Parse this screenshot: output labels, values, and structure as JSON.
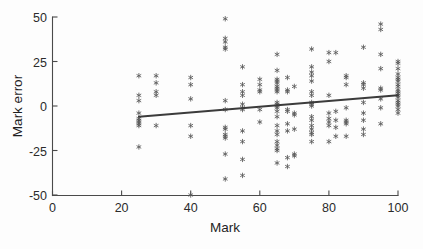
{
  "figure": {
    "background_color": "#fdfdfd",
    "axis_color": "#4a4a4a",
    "marker_color": "#5a5a5a",
    "fit_line_color": "#3b3b3b",
    "marker_symbol": "asterisk"
  },
  "chart_data": {
    "type": "scatter",
    "title": "",
    "xlabel": "Mark",
    "ylabel": "Mark error",
    "xlim": [
      0,
      100
    ],
    "ylim": [
      -50,
      50
    ],
    "xticks": [
      0,
      20,
      40,
      60,
      80,
      100
    ],
    "yticks": [
      -50,
      -25,
      0,
      25,
      50
    ],
    "xticklabels": [
      "0",
      "20",
      "40",
      "60",
      "80",
      "100"
    ],
    "yticklabels": [
      "-50",
      "-25",
      "0",
      "25",
      "50"
    ],
    "grid": false,
    "legend": null,
    "legend_position": "none",
    "marker": "*",
    "series": [
      {
        "name": "Mark error vs Mark",
        "points": [
          [
            25,
            17
          ],
          [
            25,
            6
          ],
          [
            25,
            3
          ],
          [
            25,
            -4
          ],
          [
            25,
            -7
          ],
          [
            25,
            -8
          ],
          [
            25,
            -9
          ],
          [
            25,
            -10
          ],
          [
            25,
            -11
          ],
          [
            25,
            -23
          ],
          [
            30,
            17
          ],
          [
            30,
            13
          ],
          [
            30,
            8
          ],
          [
            30,
            6
          ],
          [
            30,
            -11
          ],
          [
            40,
            16
          ],
          [
            40,
            12
          ],
          [
            40,
            4
          ],
          [
            40,
            -11
          ],
          [
            40,
            -17
          ],
          [
            40,
            -50
          ],
          [
            50,
            49
          ],
          [
            50,
            38
          ],
          [
            50,
            36
          ],
          [
            50,
            33
          ],
          [
            50,
            32
          ],
          [
            50,
            3
          ],
          [
            50,
            -2
          ],
          [
            50,
            -12
          ],
          [
            50,
            -13
          ],
          [
            50,
            -16
          ],
          [
            50,
            -17
          ],
          [
            50,
            -18
          ],
          [
            50,
            -27
          ],
          [
            50,
            -41
          ],
          [
            55,
            22
          ],
          [
            55,
            12
          ],
          [
            55,
            8
          ],
          [
            55,
            6
          ],
          [
            55,
            1
          ],
          [
            55,
            -1
          ],
          [
            55,
            -2
          ],
          [
            55,
            -14
          ],
          [
            55,
            -20
          ],
          [
            55,
            -30
          ],
          [
            55,
            -39
          ],
          [
            60,
            15
          ],
          [
            60,
            12
          ],
          [
            60,
            9
          ],
          [
            60,
            8
          ],
          [
            60,
            -2
          ],
          [
            60,
            -9
          ],
          [
            65,
            29
          ],
          [
            65,
            20
          ],
          [
            65,
            15
          ],
          [
            65,
            14
          ],
          [
            65,
            13
          ],
          [
            65,
            11
          ],
          [
            65,
            10
          ],
          [
            65,
            9
          ],
          [
            65,
            8
          ],
          [
            65,
            2
          ],
          [
            65,
            1
          ],
          [
            65,
            0
          ],
          [
            65,
            -1
          ],
          [
            65,
            -3
          ],
          [
            65,
            -6
          ],
          [
            65,
            -11
          ],
          [
            65,
            -14
          ],
          [
            65,
            -16
          ],
          [
            65,
            -20
          ],
          [
            65,
            -22
          ],
          [
            65,
            -24
          ],
          [
            65,
            -25
          ],
          [
            65,
            -32
          ],
          [
            68,
            16
          ],
          [
            68,
            9
          ],
          [
            68,
            8
          ],
          [
            68,
            -2
          ],
          [
            68,
            -3
          ],
          [
            68,
            -10
          ],
          [
            68,
            -14
          ],
          [
            68,
            -29
          ],
          [
            68,
            -34
          ],
          [
            70,
            11
          ],
          [
            70,
            -4
          ],
          [
            70,
            -5
          ],
          [
            70,
            -13
          ],
          [
            70,
            -28
          ],
          [
            70,
            -27
          ],
          [
            75,
            32
          ],
          [
            75,
            22
          ],
          [
            75,
            19
          ],
          [
            75,
            17
          ],
          [
            75,
            14
          ],
          [
            75,
            8
          ],
          [
            75,
            6
          ],
          [
            75,
            2
          ],
          [
            75,
            1
          ],
          [
            75,
            0
          ],
          [
            75,
            -6
          ],
          [
            75,
            -8
          ],
          [
            75,
            -11
          ],
          [
            75,
            -13
          ],
          [
            75,
            -15
          ],
          [
            75,
            -16
          ],
          [
            75,
            -20
          ],
          [
            80,
            30
          ],
          [
            80,
            25
          ],
          [
            80,
            6
          ],
          [
            80,
            -4
          ],
          [
            80,
            -7
          ],
          [
            80,
            -9
          ],
          [
            80,
            -11
          ],
          [
            80,
            -20
          ],
          [
            82,
            30
          ],
          [
            82,
            -3
          ],
          [
            82,
            -8
          ],
          [
            82,
            -12
          ],
          [
            82,
            -17
          ],
          [
            85,
            17
          ],
          [
            85,
            16
          ],
          [
            85,
            12
          ],
          [
            85,
            -1
          ],
          [
            85,
            -8
          ],
          [
            85,
            -9
          ],
          [
            85,
            -10
          ],
          [
            85,
            -17
          ],
          [
            90,
            33
          ],
          [
            90,
            13
          ],
          [
            90,
            12
          ],
          [
            90,
            10
          ],
          [
            90,
            2
          ],
          [
            90,
            -4
          ],
          [
            90,
            -8
          ],
          [
            90,
            -13
          ],
          [
            90,
            -16
          ],
          [
            95,
            46
          ],
          [
            95,
            43
          ],
          [
            95,
            29
          ],
          [
            95,
            21
          ],
          [
            95,
            10
          ],
          [
            95,
            9
          ],
          [
            95,
            4
          ],
          [
            95,
            -1
          ],
          [
            95,
            -10
          ],
          [
            100,
            25
          ],
          [
            100,
            24
          ],
          [
            100,
            21
          ],
          [
            100,
            18
          ],
          [
            100,
            16
          ],
          [
            100,
            15
          ],
          [
            100,
            14
          ],
          [
            100,
            12
          ],
          [
            100,
            11
          ],
          [
            100,
            9
          ],
          [
            100,
            8
          ],
          [
            100,
            7
          ],
          [
            100,
            6
          ],
          [
            100,
            5
          ],
          [
            100,
            3
          ],
          [
            100,
            2
          ],
          [
            100,
            1
          ],
          [
            100,
            0
          ],
          [
            100,
            -2
          ],
          [
            100,
            -4
          ]
        ]
      }
    ],
    "fit_line": {
      "name": "linear trend",
      "x_start": 25,
      "y_start": -6,
      "x_end": 100,
      "y_end": 6,
      "slope": 0.16,
      "intercept": -10
    }
  }
}
